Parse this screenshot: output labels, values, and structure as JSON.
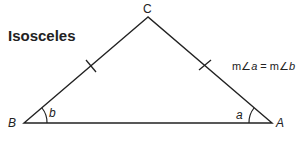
{
  "title": "Isosceles",
  "vertices": {
    "apex": {
      "label": "C",
      "x": 148,
      "y": 17
    },
    "left": {
      "label": "B",
      "x": 24,
      "y": 123
    },
    "right": {
      "label": "A",
      "x": 272,
      "y": 123
    }
  },
  "angles": {
    "left": {
      "label": "b"
    },
    "right": {
      "label": "a"
    }
  },
  "equation": {
    "prefix1": "m∠",
    "var1": "a",
    "mid": " = m∠",
    "var2": "b"
  },
  "colors": {
    "stroke": "#222222",
    "background": "#ffffff"
  }
}
